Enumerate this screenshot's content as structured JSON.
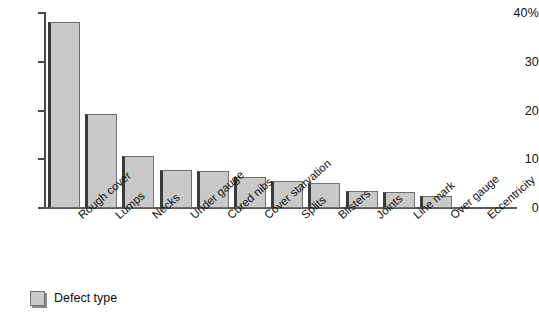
{
  "chart_data": {
    "type": "bar",
    "title": "",
    "subtitle": "",
    "xlabel": "",
    "ylabel": "",
    "ylim": [
      0,
      40
    ],
    "yticks": [
      0,
      10,
      20,
      30,
      40
    ],
    "ytick_labels": [
      "0",
      "10",
      "20",
      "30",
      "40%"
    ],
    "grid": false,
    "legend_position": "bottom-left",
    "legend_entries": [
      "Defect type"
    ],
    "categories": [
      "Rough cover",
      "Lumps",
      "Necks",
      "Under gauge",
      "Cured nibs",
      "Cover starvation",
      "Splits",
      "Blisters",
      "Joints",
      "Line mark",
      "Over gauge",
      "Eccentricity"
    ],
    "values": [
      38.2,
      19.2,
      10.6,
      7.9,
      7.6,
      6.4,
      5.6,
      5.1,
      3.4,
      3.3,
      2.5,
      0
    ],
    "series": [
      {
        "name": "Defect type",
        "values": [
          38.2,
          19.2,
          10.6,
          7.9,
          7.6,
          6.4,
          5.6,
          5.1,
          3.4,
          3.3,
          2.5,
          0
        ]
      }
    ],
    "colors": {
      "bar_fill": "#c9c9c9",
      "bar_edge": "#6f6f6f",
      "bar_shadow": "#3a3a3a",
      "axis": "#4a4a4a",
      "text": "#111111",
      "background": "#ffffff"
    }
  },
  "legend": {
    "label": "Defect type"
  }
}
